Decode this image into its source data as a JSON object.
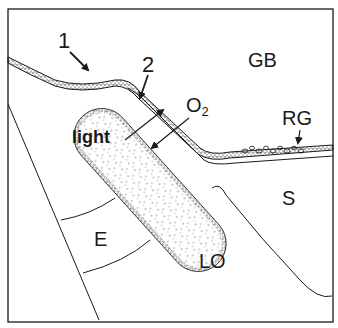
{
  "diagram": {
    "labels": {
      "one": "1",
      "two": "2",
      "gb": "GB",
      "rg": "RG",
      "light": "light",
      "o2_main": "O",
      "o2_sub": "2",
      "s": "S",
      "e": "E",
      "lo": "LO"
    },
    "colors": {
      "ink": "#1a1a1a",
      "background": "#ffffff"
    }
  }
}
